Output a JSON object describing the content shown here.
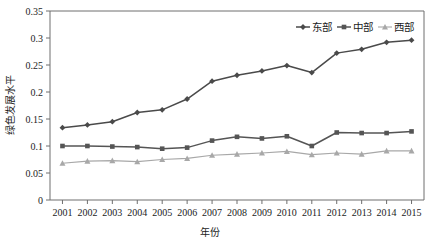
{
  "chart_data": {
    "type": "line",
    "title": "",
    "xlabel": "年份",
    "ylabel": "绿色发展水平",
    "categories": [
      "2001",
      "2002",
      "2003",
      "2004",
      "2005",
      "2006",
      "2007",
      "2008",
      "2009",
      "2010",
      "2011",
      "2012",
      "2013",
      "2014",
      "2015"
    ],
    "x_tick_labels": [
      "2001",
      "2002",
      "2003",
      "2004",
      "2005",
      "2006",
      "2007",
      "2008",
      "2009",
      "2010",
      "2011",
      "2012",
      "2013",
      "2014",
      "2015"
    ],
    "y_tick_labels": [
      "0",
      "0.05",
      "0.1",
      "0.15",
      "0.2",
      "0.25",
      "0.3",
      "0.35"
    ],
    "y_tick_values": [
      0,
      0.05,
      0.1,
      0.15,
      0.2,
      0.25,
      0.3,
      0.35
    ],
    "ylim": [
      0,
      0.35
    ],
    "grid": false,
    "legend_position": "top-right",
    "series": [
      {
        "name": "东部",
        "marker": "diamond",
        "color": "#4a4a4a",
        "values": [
          0.134,
          0.139,
          0.145,
          0.162,
          0.167,
          0.187,
          0.22,
          0.231,
          0.239,
          0.249,
          0.236,
          0.272,
          0.279,
          0.292,
          0.296
        ]
      },
      {
        "name": "中部",
        "marker": "square",
        "color": "#555555",
        "values": [
          0.1,
          0.1,
          0.099,
          0.098,
          0.095,
          0.097,
          0.11,
          0.117,
          0.114,
          0.118,
          0.1,
          0.125,
          0.124,
          0.124,
          0.127
        ]
      },
      {
        "name": "西部",
        "marker": "triangle",
        "color": "#a8a8a8",
        "values": [
          0.068,
          0.072,
          0.073,
          0.071,
          0.075,
          0.077,
          0.083,
          0.085,
          0.087,
          0.09,
          0.084,
          0.087,
          0.085,
          0.091,
          0.091
        ]
      }
    ]
  },
  "legend": {
    "items": [
      {
        "label": "东部"
      },
      {
        "label": "中部"
      },
      {
        "label": "西部"
      }
    ]
  },
  "axes": {
    "x_title": "年份",
    "y_title": "绿色发展水平"
  },
  "colors": {
    "east": "#4a4a4a",
    "central": "#555555",
    "west": "#a8a8a8",
    "frame": "#6e6e6e",
    "text": "#1c1c1c",
    "background": "#ffffff"
  }
}
